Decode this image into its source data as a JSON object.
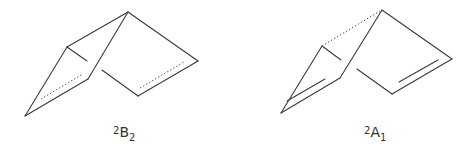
{
  "figures": [
    {
      "name": "structure-2B2",
      "label": {
        "superscript": "2",
        "symbol": "B",
        "subscript": "2"
      }
    },
    {
      "name": "structure-2A1",
      "label": {
        "superscript": "2",
        "symbol": "A",
        "subscript": "1"
      }
    }
  ]
}
